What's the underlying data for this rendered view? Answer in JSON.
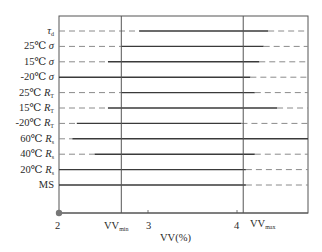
{
  "chart_data": {
    "type": "line",
    "title": "",
    "xlabel": "VV(%)",
    "ylabel": "",
    "xlim": [
      2,
      4.8
    ],
    "x_ticks": [
      "2",
      "VV_min",
      "3",
      "4",
      "VV_max"
    ],
    "x_tick_values": [
      2,
      2.7,
      3,
      4,
      4.07
    ],
    "reference_lines": [
      {
        "name": "VV_min",
        "x": 2.7
      },
      {
        "name": "VV_max",
        "x": 4.07
      }
    ],
    "grid": false,
    "legend": null,
    "rows": [
      {
        "label": "τd",
        "dashed_left_to": 2.9,
        "solid": [
          2.9,
          4.35
        ],
        "dashed_right_from": 4.35
      },
      {
        "label": "25℃ σ",
        "dashed_left_to": 2.7,
        "solid": [
          2.7,
          4.3
        ],
        "dashed_right_from": 4.3
      },
      {
        "label": "15℃ σ",
        "dashed_left_to": 2.55,
        "solid": [
          2.55,
          4.25
        ],
        "dashed_right_from": 4.25
      },
      {
        "label": "-20℃ σ",
        "dashed_left_to": 2.0,
        "solid": [
          2.0,
          4.15
        ],
        "dashed_right_from": 4.15
      },
      {
        "label": "25℃ RT",
        "dashed_left_to": 2.7,
        "solid": [
          2.7,
          4.2
        ],
        "dashed_right_from": 4.2
      },
      {
        "label": "15℃ RT",
        "dashed_left_to": 2.55,
        "solid": [
          2.55,
          4.45
        ],
        "dashed_right_from": 4.45
      },
      {
        "label": "-20℃ RT",
        "dashed_left_to": 2.2,
        "solid": [
          2.2,
          4.05
        ],
        "dashed_right_from": 4.05
      },
      {
        "label": "60℃ Rs",
        "dashed_left_to": 2.15,
        "solid": [
          2.15,
          4.8
        ],
        "dashed_right_from": null
      },
      {
        "label": "40℃ Rs",
        "dashed_left_to": 2.4,
        "solid": [
          2.4,
          4.2
        ],
        "dashed_right_from": 4.2
      },
      {
        "label": "20℃ Rs",
        "dashed_left_to": 2.0,
        "solid": [
          2.0,
          4.1
        ],
        "dashed_right_from": 4.1
      },
      {
        "label": "MS",
        "dashed_left_to": 2.0,
        "solid": [
          2.0,
          4.1
        ],
        "dashed_right_from": 4.1
      }
    ]
  },
  "labels": {
    "rows": [
      {
        "main": "τ",
        "sub": "d",
        "prefix": ""
      },
      {
        "prefix": "25℃ ",
        "main": "σ",
        "sub": ""
      },
      {
        "prefix": "15℃ ",
        "main": "σ",
        "sub": ""
      },
      {
        "prefix": "-20℃ ",
        "main": "σ",
        "sub": ""
      },
      {
        "prefix": "25℃ ",
        "main": "R",
        "sub": "T"
      },
      {
        "prefix": "15℃ ",
        "main": "R",
        "sub": "T"
      },
      {
        "prefix": "-20℃ ",
        "main": "R",
        "sub": "T"
      },
      {
        "prefix": "60℃ ",
        "main": "R",
        "sub": "s"
      },
      {
        "prefix": "40℃ ",
        "main": "R",
        "sub": "s"
      },
      {
        "prefix": "20℃ ",
        "main": "R",
        "sub": "s"
      },
      {
        "prefix": "MS",
        "main": "",
        "sub": ""
      }
    ],
    "x_ticks": {
      "t2": "2",
      "vvmin_main": "VV",
      "vvmin_sub": "min",
      "t3": "3",
      "t4": "4",
      "vvmax_main": "VV",
      "vvmax_sub": "max"
    },
    "x_title": "VV(%)"
  },
  "colors": {
    "line": "#3a3a3a",
    "frame": "#555555",
    "dash": "#8a8a8a",
    "origin_dot": "#777777"
  }
}
